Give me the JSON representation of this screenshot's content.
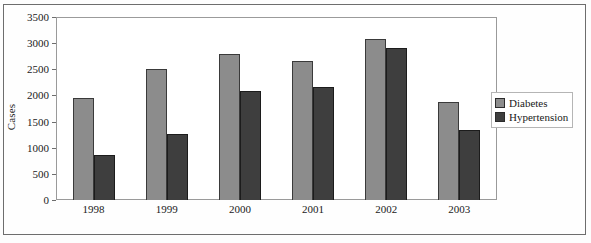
{
  "chart_data": {
    "type": "bar",
    "title": "",
    "xlabel": "",
    "ylabel": "Cases",
    "categories": [
      "1998",
      "1999",
      "2000",
      "2001",
      "2002",
      "2003"
    ],
    "series": [
      {
        "name": "Diabetes",
        "color": "#8c8c8c",
        "values": [
          1960,
          2500,
          2790,
          2660,
          3080,
          1870
        ]
      },
      {
        "name": "Hypertension",
        "color": "#3e3e3e",
        "values": [
          870,
          1270,
          2090,
          2160,
          2910,
          1330
        ]
      }
    ],
    "ylim": [
      0,
      3500
    ],
    "ytick_step": 500,
    "yticks": [
      "0",
      "500",
      "1000",
      "1500",
      "2000",
      "2500",
      "3000",
      "3500"
    ],
    "grid": false,
    "legend_position": "right"
  },
  "legend": {
    "items": [
      {
        "label": "Diabetes"
      },
      {
        "label": "Hypertension"
      }
    ]
  },
  "axes": {
    "y_title": "Cases"
  }
}
